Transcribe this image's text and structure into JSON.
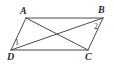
{
  "figure": {
    "kind": "parallelogram-with-diagonals",
    "stroke_color": "#4a4a4a",
    "background_color": "#ffffff",
    "stroke_width": 1,
    "width": 114,
    "height": 65
  },
  "vertices": {
    "A": {
      "label": "A",
      "x": 26,
      "y": 18,
      "label_x": 20,
      "label_y": 6
    },
    "B": {
      "label": "B",
      "x": 103,
      "y": 18,
      "label_x": 98,
      "label_y": 5
    },
    "C": {
      "label": "C",
      "x": 88,
      "y": 50,
      "label_x": 85,
      "label_y": 52
    },
    "D": {
      "label": "D",
      "x": 11,
      "y": 50,
      "label_x": 7,
      "label_y": 52
    }
  },
  "edges": [
    {
      "name": "side-AB",
      "from": "A",
      "to": "B"
    },
    {
      "name": "side-BC",
      "from": "B",
      "to": "C"
    },
    {
      "name": "side-CD",
      "from": "C",
      "to": "D"
    },
    {
      "name": "side-DA",
      "from": "D",
      "to": "A"
    }
  ],
  "diagonals": [
    {
      "name": "diagonal-AC",
      "from": "A",
      "to": "C"
    },
    {
      "name": "diagonal-DB",
      "from": "D",
      "to": "B"
    }
  ],
  "intersection": {
    "x": 58,
    "y": 31
  },
  "angle_labels": [
    {
      "id": "angle-1",
      "text": "1",
      "at_vertex": "D",
      "x": 15,
      "y": 39
    },
    {
      "id": "angle-2",
      "text": "2",
      "at_vertex": "B",
      "x": 94,
      "y": 23
    }
  ]
}
